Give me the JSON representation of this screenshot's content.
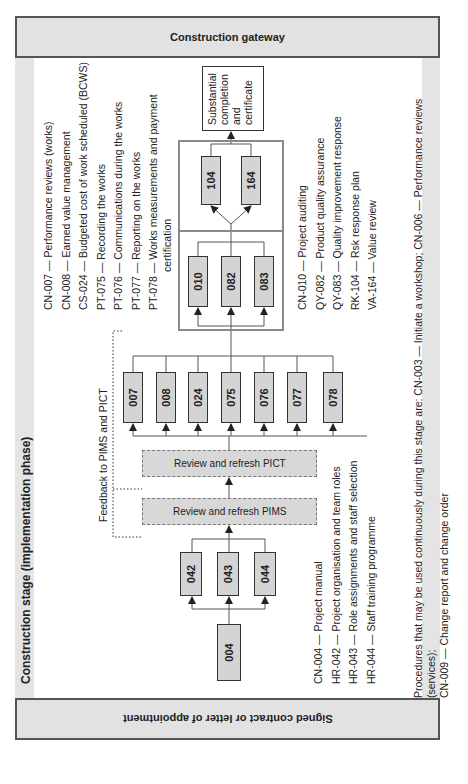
{
  "gateways": {
    "start": "Signed contract or letter of appointment",
    "end": "Construction gateway"
  },
  "stage": {
    "title": "Construction stage (implementation phase)",
    "feedback_label": "Feedback to PIMS and PICT"
  },
  "boxes": {
    "start": "004",
    "group1": [
      "042",
      "043",
      "044"
    ],
    "review_pims": "Review and refresh PIMS",
    "review_pict": "Review and refresh PICT",
    "group2": [
      "007",
      "008",
      "024",
      "075",
      "076",
      "077",
      "078"
    ],
    "group3": [
      "010",
      "082",
      "083"
    ],
    "group4": [
      "104",
      "164"
    ],
    "outcome": [
      "Substantial",
      "completion",
      "and",
      "certificate"
    ]
  },
  "legends": {
    "group1": [
      "CN-004 — Project manual",
      "HR-042 — Project organisation and team roles",
      "HR-043 — Role assignments and staff selection",
      "HR-044 — Staff training programme"
    ],
    "group2": [
      "CN-007 — Performance reviews (works)",
      "CN-008 — Earned value management",
      "CS-024 — Budgeted cost of work scheduled (BCWS)",
      "PT-075 — Recording the works",
      "PT-076 — Communications during the works",
      "PT-077 — Reporting on the works",
      "PT-078 — Works measurements and payment",
      "certification"
    ],
    "group3": [
      "CN-010 — Project auditing",
      "QY-082 — Product quality assurance",
      "QY-083 — Quality improvement response",
      "RK-104 — Rsk response plan",
      "VA-164 — Value review"
    ]
  },
  "note": {
    "line1": "Procedures that may be used continuously during this stage are: CN-003 — Initiate a workshop; CN-006 — Performance reviews (services);",
    "line2": "CN-009 — Change report and change order"
  },
  "colors": {
    "gateway_fill": "#e2e2e2",
    "box_fill": "#d4d4d4",
    "stage_band": "#e4e4e4",
    "border": "#333333"
  }
}
